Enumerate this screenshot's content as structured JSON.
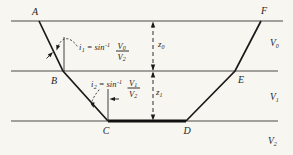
{
  "figure": {
    "points": {
      "a": "A",
      "b": "B",
      "c": "C",
      "d": "D",
      "e": "E",
      "f": "F"
    },
    "layers": [
      {
        "velocity_base": "V",
        "velocity_sub": "0"
      },
      {
        "velocity_base": "V",
        "velocity_sub": "1"
      },
      {
        "velocity_base": "V",
        "velocity_sub": "2"
      }
    ],
    "depths": [
      {
        "base": "z",
        "sub": "0"
      },
      {
        "base": "z",
        "sub": "1"
      }
    ],
    "angles": [
      {
        "var": "i",
        "var_sub": "1",
        "rel": "= sin",
        "exp": "-1",
        "num": "V",
        "num_sub": "0",
        "den": "V",
        "den_sub": "2"
      },
      {
        "var": "i",
        "var_sub": "2",
        "rel": "= sin",
        "exp": "-1",
        "num": "V",
        "num_sub": "1",
        "den": "V",
        "den_sub": "2"
      }
    ]
  },
  "colors": {
    "background": "#f8f6f1",
    "interface_line": "#4a4a4a",
    "ray": "#1a1a1a",
    "text": "#1f1f1f"
  }
}
